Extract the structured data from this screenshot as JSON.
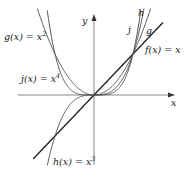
{
  "figure": {
    "axes": {
      "x_label": "x",
      "y_label": "y",
      "origin_px": [
        94,
        95
      ],
      "unit_px": [
        39,
        41
      ],
      "x_range": [
        -2,
        2
      ],
      "y_range": [
        -2,
        2
      ],
      "grid": false,
      "color": "#888888"
    },
    "curves": [
      {
        "id": "f",
        "expr": "x",
        "label": "f(x) = x",
        "short_label": "",
        "color": "#222222",
        "width": 1.4
      },
      {
        "id": "g",
        "expr": "x^2",
        "label": "g(x) = x",
        "label_exp": "2",
        "short_label": "g",
        "color": "#555555",
        "width": 1.0
      },
      {
        "id": "h",
        "expr": "x^3",
        "label": "h(x) = x",
        "label_exp": "3",
        "short_label": "h",
        "color": "#555555",
        "width": 1.0
      },
      {
        "id": "j",
        "expr": "x^4",
        "label": "j(x) = x",
        "label_exp": "4",
        "short_label": "j",
        "color": "#555555",
        "width": 1.0
      }
    ]
  },
  "chart_data": {
    "type": "line",
    "title": "",
    "xlabel": "x",
    "ylabel": "y",
    "grid": false,
    "legend": "inline labels",
    "series": [
      {
        "name": "f(x) = x",
        "function": "x"
      },
      {
        "name": "g(x) = x^2",
        "function": "x^2"
      },
      {
        "name": "h(x) = x^3",
        "function": "x^3"
      },
      {
        "name": "j(x) = x^4",
        "function": "x^4"
      }
    ],
    "annotations": [
      "g(x) = x^2",
      "j(x) = x^4",
      "h(x) = x^3",
      "f(x) = x",
      "j",
      "h",
      "g"
    ],
    "intersections": [
      [
        0,
        0
      ],
      [
        1,
        1
      ]
    ]
  }
}
